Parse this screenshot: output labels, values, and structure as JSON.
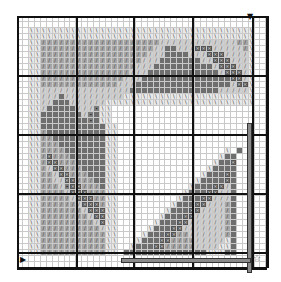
{
  "chart": {
    "type": "cross-stitch pattern",
    "columns": 42,
    "rows": 42,
    "major_every": 10,
    "legend_codes": {
      ".": "empty",
      "b": "light border stitch (\\ symbol)",
      "l": "light gray (/ symbol)",
      "m": "medium gray (/ symbol)",
      "d": "dark gray",
      "D": "darkest (x symbol)",
      "s": "dark gray (dot symbol)"
    },
    "colors": {
      "b": "#e8e8e8",
      "l": "#cfcfcf",
      "m": "#a6a6a6",
      "d": "#6e6e6e",
      "D": "#555555",
      "s": "#7d7d7d"
    },
    "grid": [
      "..........................................",
      "..........................................",
      "..bbbbbbbbbbbbbbbbbbbbbbbbbbbbbbbbbbbbbb..",
      "..bbbbbbbbbbbbbbbbbbbbbbbbbbbbbbbbbbbbbb..",
      "..bbmmmmmmmmmmmmmmmmmmmmlllllllllllllmmb..",
      "..bbmmmmmmmmmmmmmmmmmmmllddlllDDDlllllmb..",
      "..bbmmmmmmmmmmmmmmmmmmlllddddlllDDDllllb..",
      "..bbmmmmmmmmmmmmmmmmmllldddddddllDDDlllb..",
      "..bbmmmmmmmmmmmmmmmmlllddddddddddlDDDllb..",
      "..bbmmmmmmmmmmmmmmmlllddddddddddddlDDDlb..",
      "..bbmmmmmmmmmmmmmmllldddddddddddddddDDlb..",
      "..bbmmmmmmmmmmmmmlllddddddddddddddddlDDb..",
      "..bbllllllllllllllldddddddddddddddlllllb..",
      "..bbllldllllllllllbbbbbbbbbbbbbbbbbbbbbb..",
      "..bblldddllllllbbbbbbbbbbbbbbbbbbbbbbbbb..",
      "..bbldddddlllsbb..........................",
      "..bbdddddddlsdbb..........................",
      "..bbddddddddsdbb..........................",
      "..bbdddddddddddbb.........................",
      "..bbmddddddddddbb.........................",
      "..bbmmdddddddddbb.........................",
      "..bbmmmddddddddbb.........................",
      "..bbmmmmdddddddbb..................b.d....",
      "..bbmDmmmddddddbb.................bdd.....",
      "..bbmDDmmmdddddbb................bddD.....",
      "..bbmlDDmmmddddbb...............bdddd.....",
      "..bbmmlDDmmmdddbb..............bdddDd.....",
      "..bbmmllDDmmmddbb.............bddddDd.....",
      "..bbmmmlsDDmmmdbb............bdddDDld.....",
      "..bbmmmmlDDDmmmbb...........bdddDDlld.....",
      "..bbmmmmmlDDDmmbb..........bdddDDllld.....",
      "..bbmmmmmmlDDDmbb.........bdddDDlllmd.....",
      "..bbmmmmmmmlDDDbb........bdddDDllllmd.....",
      "..bbmmmmmmmmlDDbb.......bdddDDlllllmd.....",
      "..bbmmmmmmmmmlDbb......bdddDDllllllmd.....",
      "..bbmmmmmmmmmmlbb.....bdddDDlllllllmd.....",
      "..bbmmmmmmmmmmmbb....bdddDDmmllllllmd.....",
      "..bbmmmmmmmmmmmbb...bdddDDmmmmlllllbd.....",
      "..bbmmmmmmmmmmmbb..bdddDDmmmmmllllbbd.....",
      "..bbmmmmmmmmmmmbb.ddddddddddddddbbbdd.....",
      "..........................................",
      ".........................................."
    ],
    "major_lines": {
      "vertical_px": [
        0,
        59,
        116,
        175,
        235,
        250
      ],
      "horizontal_px": [
        0,
        59,
        118,
        177,
        236,
        252
      ]
    },
    "markers": {
      "top": "▼",
      "left": "▶",
      "corner": "☆"
    },
    "overlay_bars": [
      {
        "x": 230,
        "y": 107,
        "w": 5,
        "h": 150
      },
      {
        "x": 104,
        "y": 242,
        "w": 130,
        "h": 5
      }
    ]
  }
}
